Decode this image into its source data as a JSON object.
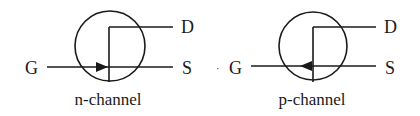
{
  "diagram": {
    "colors": {
      "stroke": "#1a1a1a",
      "background": "#ffffff"
    },
    "symbols": [
      {
        "id": "n-channel",
        "caption": "n-channel",
        "arrow_direction": "right",
        "terminals": {
          "gate": "G",
          "drain": "D",
          "source": "S"
        }
      },
      {
        "id": "p-channel",
        "caption": "p-channel",
        "arrow_direction": "left",
        "terminals": {
          "gate": "G",
          "drain": "D",
          "source": "S"
        }
      }
    ],
    "stray_mark": "·"
  }
}
